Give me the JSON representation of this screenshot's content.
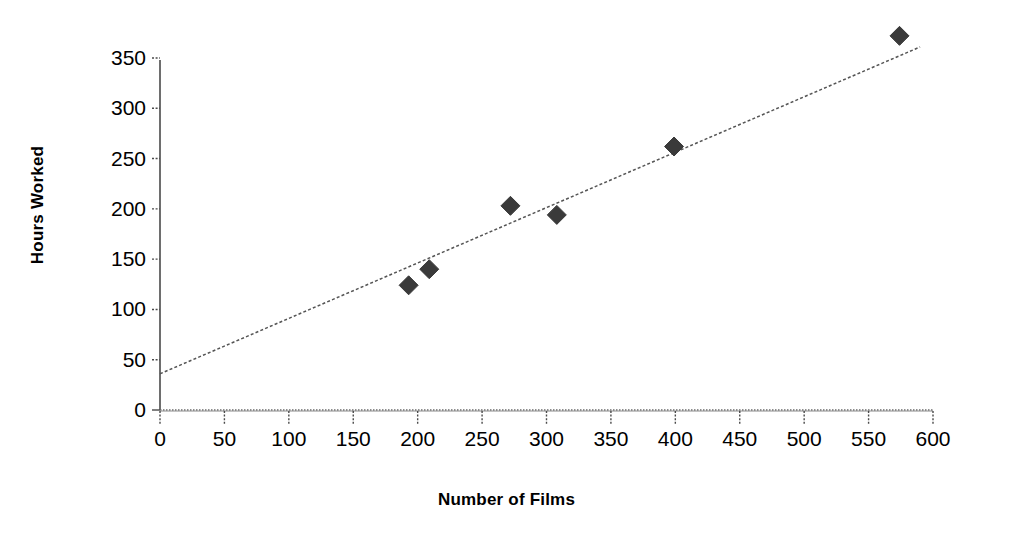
{
  "chart_data": {
    "type": "scatter",
    "title": "",
    "xlabel": "Number of Films",
    "ylabel": "Hours Worked",
    "xlim": [
      0,
      600
    ],
    "ylim": [
      0,
      350
    ],
    "xticks": [
      0,
      50,
      100,
      150,
      200,
      250,
      300,
      350,
      400,
      450,
      500,
      550,
      600
    ],
    "xtick_labels": [
      "0",
      "50",
      "100",
      "150",
      "200",
      "250",
      "300",
      "350",
      "400",
      "450",
      "500",
      "550",
      "600"
    ],
    "yticks": [
      0,
      50,
      100,
      150,
      200,
      250,
      300,
      350
    ],
    "ytick_labels": [
      "0",
      "50",
      "100",
      "150",
      "200",
      "250",
      "300",
      "350"
    ],
    "grid": false,
    "legend": null,
    "marker_shape": "diamond",
    "marker_color": "#3a3a3a",
    "trendline_color": "#555555",
    "trendline_style": "dashed",
    "points": [
      {
        "x": 193,
        "y": 124
      },
      {
        "x": 209,
        "y": 140
      },
      {
        "x": 272,
        "y": 203
      },
      {
        "x": 308,
        "y": 194
      },
      {
        "x": 399,
        "y": 262
      },
      {
        "x": 574,
        "y": 372
      }
    ],
    "series": [
      {
        "name": "Hours Worked vs Number of Films",
        "x": [
          193,
          209,
          272,
          308,
          399,
          574
        ],
        "values": [
          124,
          140,
          203,
          194,
          262,
          372
        ]
      }
    ],
    "trendline": {
      "type": "linear",
      "slope": 0.551,
      "intercept": 36,
      "x_start": 0,
      "y_start": 36,
      "x_end": 590,
      "y_end": 361
    }
  },
  "axes": {
    "y_title": "Hours Worked",
    "x_title": "Number of Films"
  }
}
